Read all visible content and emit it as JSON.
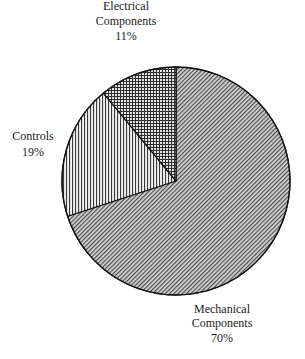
{
  "chart_data": {
    "type": "pie",
    "title": "",
    "start_angle": "12 o'clock",
    "direction": "clockwise",
    "legend": "none (direct slice labels)",
    "categories": [
      "Mechanical Components",
      "Controls",
      "Electrical Components"
    ],
    "values": [
      70,
      19,
      11
    ],
    "unit": "%",
    "slices": [
      {
        "name": "Mechanical Components",
        "value": 70,
        "label_lines": [
          "Mechanical",
          "Components",
          "70%"
        ],
        "fill_pattern": "diagonal-hatch",
        "label_position": "bottom-right, outside"
      },
      {
        "name": "Controls",
        "value": 19,
        "label_lines": [
          "Controls",
          "19%"
        ],
        "fill_pattern": "vertical-lines",
        "label_position": "left, outside"
      },
      {
        "name": "Electrical Components",
        "value": 11,
        "label_lines": [
          "Electrical",
          "Components",
          "11%"
        ],
        "fill_pattern": "crosshatch",
        "label_position": "top, outside"
      }
    ]
  },
  "colors": {
    "outline": "#111111",
    "pattern_ink": "#333333",
    "background": "#ffffff",
    "text": "#1a1a1a"
  }
}
